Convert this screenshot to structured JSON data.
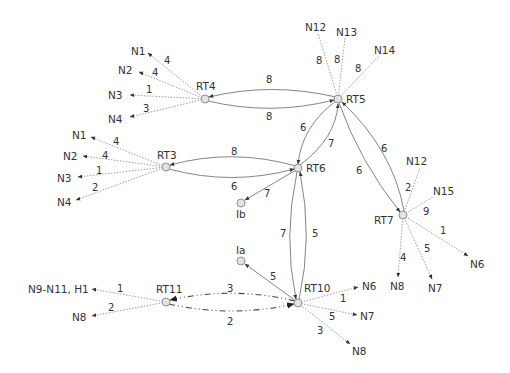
{
  "diagram": {
    "type": "network-topology",
    "routers": [
      {
        "id": "RT4",
        "label": "RT4",
        "x": 205,
        "y": 99
      },
      {
        "id": "RT5",
        "label": "RT5",
        "x": 338,
        "y": 99
      },
      {
        "id": "RT3",
        "label": "RT3",
        "x": 166,
        "y": 167
      },
      {
        "id": "RT6",
        "label": "RT6",
        "x": 298,
        "y": 168
      },
      {
        "id": "RT7",
        "label": "RT7",
        "x": 403,
        "y": 215
      },
      {
        "id": "RT10",
        "label": "RT10",
        "x": 298,
        "y": 303
      },
      {
        "id": "RT11",
        "label": "RT11",
        "x": 166,
        "y": 302
      }
    ],
    "interfaces": [
      {
        "id": "Ib",
        "label": "Ib",
        "x": 241,
        "y": 203
      },
      {
        "id": "Ia",
        "label": "Ia",
        "x": 241,
        "y": 261
      }
    ],
    "router_links": [
      {
        "from": "RT5",
        "to": "RT4",
        "cost": "8"
      },
      {
        "from": "RT4",
        "to": "RT5",
        "cost": "8"
      },
      {
        "from": "RT6",
        "to": "RT3",
        "cost": "8"
      },
      {
        "from": "RT3",
        "to": "RT6",
        "cost": "6"
      },
      {
        "from": "RT5",
        "to": "RT6",
        "cost": "6"
      },
      {
        "from": "RT6",
        "to": "RT5",
        "cost": "7"
      },
      {
        "from": "RT7",
        "to": "RT5",
        "cost": "6"
      },
      {
        "from": "RT5",
        "to": "RT7",
        "cost": "6"
      },
      {
        "from": "RT10",
        "to": "RT6",
        "cost": "5"
      },
      {
        "from": "RT6",
        "to": "RT10",
        "cost": "7"
      },
      {
        "from": "RT6",
        "to": "Ib",
        "cost": "7"
      },
      {
        "from": "RT10",
        "to": "Ia",
        "cost": "5"
      },
      {
        "from": "RT10",
        "to": "RT11",
        "cost": "3",
        "style": "dash-dot"
      },
      {
        "from": "RT11",
        "to": "RT10",
        "cost": "2",
        "style": "dash-dot"
      }
    ],
    "stub_networks": [
      {
        "router": "RT4",
        "network": "N1",
        "cost": "4"
      },
      {
        "router": "RT4",
        "network": "N2",
        "cost": "4"
      },
      {
        "router": "RT4",
        "network": "N3",
        "cost": "1"
      },
      {
        "router": "RT4",
        "network": "N4",
        "cost": "3"
      },
      {
        "router": "RT3",
        "network": "N1",
        "cost": "4"
      },
      {
        "router": "RT3",
        "network": "N2",
        "cost": "4"
      },
      {
        "router": "RT3",
        "network": "N3",
        "cost": "1"
      },
      {
        "router": "RT3",
        "network": "N4",
        "cost": "2"
      },
      {
        "router": "RT5",
        "network": "N12",
        "cost": "8"
      },
      {
        "router": "RT5",
        "network": "N13",
        "cost": "8"
      },
      {
        "router": "RT5",
        "network": "N14",
        "cost": "8"
      },
      {
        "router": "RT7",
        "network": "N12",
        "cost": "2"
      },
      {
        "router": "RT7",
        "network": "N15",
        "cost": "9"
      },
      {
        "router": "RT7",
        "network": "N6",
        "cost": "1"
      },
      {
        "router": "RT7",
        "network": "N8",
        "cost": "4"
      },
      {
        "router": "RT7",
        "network": "N7",
        "cost": "5"
      },
      {
        "router": "RT10",
        "network": "N6",
        "cost": "1"
      },
      {
        "router": "RT10",
        "network": "N7",
        "cost": "5"
      },
      {
        "router": "RT10",
        "network": "N8",
        "cost": "3"
      },
      {
        "router": "RT11",
        "network": "N9-N11, H1",
        "cost": "1"
      },
      {
        "router": "RT11",
        "network": "N8",
        "cost": "2"
      }
    ],
    "labels": {
      "rt4": "RT4",
      "rt5": "RT5",
      "rt3": "RT3",
      "rt6": "RT6",
      "rt7": "RT7",
      "rt10": "RT10",
      "rt11": "RT11",
      "ib": "Ib",
      "ia": "Ia",
      "rt4_n1": "N1",
      "rt4_n2": "N2",
      "rt4_n3": "N3",
      "rt4_n4": "N4",
      "rt4_c1": "4",
      "rt4_c2": "4",
      "rt4_c3": "1",
      "rt4_c4": "3",
      "rt3_n1": "N1",
      "rt3_n2": "N2",
      "rt3_n3": "N3",
      "rt3_n4": "N4",
      "rt3_c1": "4",
      "rt3_c2": "4",
      "rt3_c3": "1",
      "rt3_c4": "2",
      "rt5_n12": "N12",
      "rt5_n13": "N13",
      "rt5_n14": "N14",
      "rt5_c12": "8",
      "rt5_c13": "8",
      "rt5_c14": "8",
      "rt7_n12": "N12",
      "rt7_n15": "N15",
      "rt7_n6": "N6",
      "rt7_n8": "N8",
      "rt7_n7": "N7",
      "rt7_c12": "2",
      "rt7_c15": "9",
      "rt7_c6": "1",
      "rt7_c8": "4",
      "rt7_c7": "5",
      "rt10_n6": "N6",
      "rt10_n7": "N7",
      "rt10_n8": "N8",
      "rt10_c6": "1",
      "rt10_c7": "5",
      "rt10_c8": "3",
      "rt11_n9": "N9-N11, H1",
      "rt11_n8": "N8",
      "rt11_c9": "1",
      "rt11_c8": "2",
      "l_rt5_rt4": "8",
      "l_rt4_rt5": "8",
      "l_rt6_rt3": "8",
      "l_rt3_rt6": "6",
      "l_rt5_rt6": "6",
      "l_rt6_rt5": "7",
      "l_rt7_rt5": "6",
      "l_rt5_rt7": "6",
      "l_rt6_ib": "7",
      "l_rt6_rt10": "7",
      "l_rt10_rt6": "5",
      "l_rt10_ia": "5",
      "l_rt10_rt11": "3",
      "l_rt11_rt10": "2"
    }
  }
}
